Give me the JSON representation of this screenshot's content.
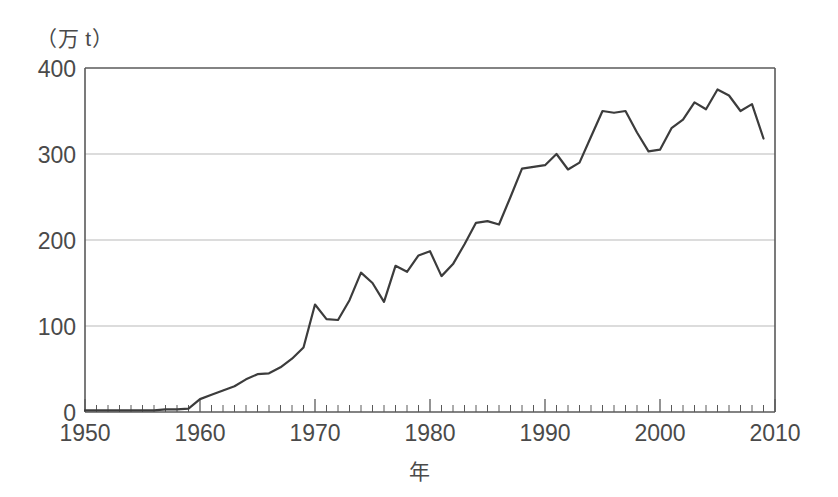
{
  "chart_data": {
    "type": "line",
    "title": "",
    "unit_label": "（万 t）",
    "xlabel": "年",
    "ylabel": "",
    "xlim": [
      1950,
      2010
    ],
    "ylim": [
      0,
      400
    ],
    "y_ticks": [
      0,
      100,
      200,
      300,
      400
    ],
    "x_ticks": [
      1950,
      1960,
      1970,
      1980,
      1990,
      2000,
      2010
    ],
    "x_minor_tick_interval": 1,
    "grid": "horizontal",
    "legend": "none",
    "line_color": "#3c3c3c",
    "line_width": 2.2,
    "series_name": "",
    "x": [
      1950,
      1951,
      1952,
      1953,
      1954,
      1955,
      1956,
      1957,
      1958,
      1959,
      1960,
      1961,
      1962,
      1963,
      1964,
      1965,
      1966,
      1967,
      1968,
      1969,
      1970,
      1971,
      1972,
      1973,
      1974,
      1975,
      1976,
      1977,
      1978,
      1979,
      1980,
      1981,
      1982,
      1983,
      1984,
      1985,
      1986,
      1987,
      1988,
      1989,
      1990,
      1991,
      1992,
      1993,
      1994,
      1995,
      1996,
      1997,
      1998,
      1999,
      2000,
      2001,
      2002,
      2003,
      2004,
      2005,
      2006,
      2007,
      2008,
      2009
    ],
    "values": [
      2,
      2,
      2,
      2,
      2,
      2,
      2,
      3,
      3,
      4,
      15,
      20,
      25,
      30,
      38,
      44,
      45,
      52,
      62,
      75,
      125,
      108,
      107,
      130,
      162,
      150,
      128,
      170,
      163,
      182,
      187,
      158,
      172,
      195,
      220,
      222,
      218,
      250,
      283,
      285,
      287,
      300,
      282,
      290,
      320,
      350,
      348,
      350,
      325,
      303,
      305,
      330,
      340,
      360,
      352,
      375,
      368,
      350,
      358,
      318
    ]
  },
  "axis_text": {
    "y_tick_labels": [
      "400",
      "300",
      "200",
      "100",
      "0"
    ],
    "x_tick_labels": [
      "1950",
      "1960",
      "1970",
      "1980",
      "1990",
      "2000",
      "2010"
    ]
  }
}
